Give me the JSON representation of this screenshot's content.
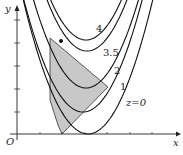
{
  "axes": {
    "x_label": "x",
    "y_label": "y",
    "origin_label": "O"
  },
  "curves": [
    {
      "label": "z=0",
      "vx": 88,
      "vy": 134,
      "k": 0.032,
      "lx": 126,
      "ly": 106
    },
    {
      "label": "1",
      "vx": 83,
      "vy": 112,
      "k": 0.032,
      "lx": 120,
      "ly": 90
    },
    {
      "label": "2",
      "vx": 86,
      "vy": 88,
      "k": 0.032,
      "lx": 114,
      "ly": 74
    },
    {
      "label": "3.5",
      "vx": 87,
      "vy": 51,
      "k": 0.032,
      "lx": 103,
      "ly": 56
    },
    {
      "label": "4",
      "vx": 86,
      "vy": 40,
      "k": 0.032,
      "lx": 96,
      "ly": 32
    }
  ],
  "region": {
    "points": "50,38 108,87 62,134 58,125 50,100",
    "fill": "#c8c8c8"
  },
  "optimum_point": {
    "x": 61,
    "y": 41
  },
  "caption": ""
}
